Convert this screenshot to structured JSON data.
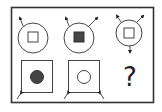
{
  "puzzle": {
    "question_mark": "?",
    "colors": {
      "stroke": "#333333",
      "fill_dark": "#444444",
      "background": "#ffffff"
    },
    "top_row": [
      {
        "outer": "circle",
        "inner": "square",
        "inner_fill": "white",
        "arrows": [
          "up-left"
        ]
      },
      {
        "outer": "circle",
        "inner": "square",
        "inner_fill": "dark",
        "arrows": [
          "up-left",
          "up-right"
        ]
      },
      {
        "outer": "circle",
        "inner": "square",
        "inner_fill": "white",
        "arrows": [
          "up-left",
          "up-right",
          "down"
        ]
      }
    ],
    "bottom_row": [
      {
        "outer": "square",
        "inner": "circle",
        "inner_fill": "dark",
        "arrows": [
          "down-left"
        ]
      },
      {
        "outer": "square",
        "inner": "circle",
        "inner_fill": "white",
        "arrows": [
          "down-left",
          "down-right"
        ]
      },
      {
        "outer": "unknown",
        "label": "?"
      }
    ]
  }
}
